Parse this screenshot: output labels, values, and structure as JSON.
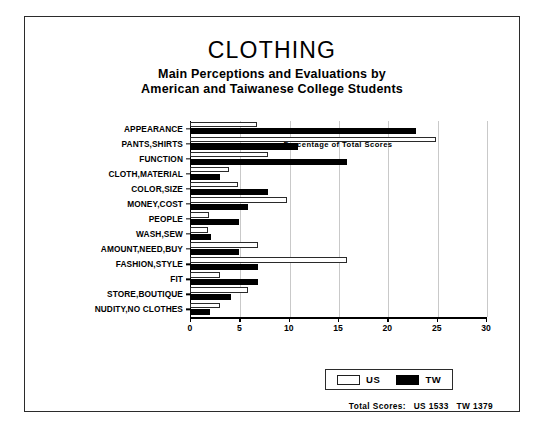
{
  "chart_data": {
    "type": "bar",
    "orientation": "horizontal",
    "title": "CLOTHING",
    "subtitle_line1": "Main Perceptions and Evaluations by",
    "subtitle_line2": "American and Taiwanese College Students",
    "xlabel": "Percentage of Total Scores",
    "ylabel": "",
    "xlim": [
      0,
      30
    ],
    "xticks": [
      0,
      5,
      10,
      15,
      20,
      25,
      30
    ],
    "grid": true,
    "legend_position": "bottom-right",
    "categories": [
      "APPEARANCE",
      "PANTS,SHIRTS",
      "FUNCTION",
      "CLOTH,MATERIAL",
      "COLOR,SIZE",
      "MONEY,COST",
      "PEOPLE",
      "WASH,SEW",
      "AMOUNT,NEED,BUY",
      "FASHION,STYLE",
      "FIT",
      "STORE,BOUTIQUE",
      "NUDITY,NO CLOTHES"
    ],
    "series": [
      {
        "name": "US",
        "color": "#ffffff",
        "values": [
          6.8,
          24.9,
          7.9,
          4.0,
          4.9,
          9.8,
          1.9,
          1.8,
          6.9,
          15.9,
          3.0,
          5.9,
          3.0
        ]
      },
      {
        "name": "TW",
        "color": "#000000",
        "values": [
          22.9,
          10.9,
          15.9,
          3.0,
          7.9,
          5.9,
          5.0,
          2.1,
          5.0,
          6.9,
          6.9,
          4.2,
          2.0
        ]
      }
    ]
  },
  "legend": {
    "us_label": "US",
    "tw_label": "TW"
  },
  "footer": {
    "label": "Total Scores:",
    "us_total": "US 1533",
    "tw_total": "TW 1379"
  }
}
